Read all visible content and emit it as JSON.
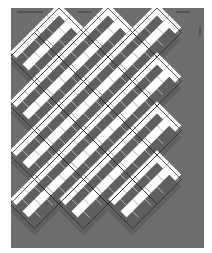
{
  "diagram": {
    "colors": {
      "page": "#ffffff",
      "background": "#6e6e6e",
      "light_square": "#ffffff",
      "dark_square": "#5f5f5f",
      "seam_line": "#2a2a2a",
      "marker": "#3a3a3a"
    },
    "canvas": {
      "width": 212,
      "height": 253
    },
    "field": {
      "x": 11,
      "y": 8,
      "width": 193,
      "height": 240
    },
    "lattice_step": 12.25,
    "block_apexes_top_x": [
      59,
      108,
      157
    ],
    "block_apexes_left_y": [
      56,
      104,
      152,
      200
    ],
    "markers": [
      {
        "name": "top-arrow-left",
        "x1": 17,
        "y1": 12,
        "x2": 43,
        "y2": 12
      },
      {
        "name": "top-arrow-middle",
        "x1": 78,
        "y1": 12,
        "x2": 92,
        "y2": 12
      },
      {
        "name": "top-arrow-right",
        "x1": 176,
        "y1": 12,
        "x2": 190,
        "y2": 12
      },
      {
        "name": "right-arrow-vertical",
        "x1": 200,
        "y1": 27,
        "x2": 200,
        "y2": 36
      }
    ]
  }
}
